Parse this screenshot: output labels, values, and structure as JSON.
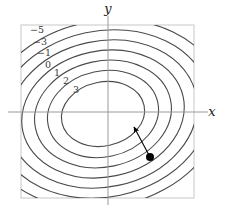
{
  "figure": {
    "title": "",
    "background_color": "#ffffff"
  },
  "axes": {
    "x_label": "x",
    "y_label": "y",
    "x_axis_color": "#9a9a9a",
    "y_axis_color": "#9a9a9a",
    "frame_color": "#c8c8c8",
    "origin_px": {
      "x": 108,
      "y": 112
    }
  },
  "chart_data": {
    "type": "line",
    "subtype": "contour",
    "title": "",
    "xlabel": "x",
    "ylabel": "y",
    "grid": false,
    "legend": null,
    "contour_color": "#4a4a4a",
    "labeled_levels": [
      -5,
      -3,
      -1,
      0,
      1,
      2,
      3
    ],
    "level_labels": [
      "-5",
      "-3",
      "-1",
      "0",
      "1",
      "2",
      "3"
    ],
    "label_positions_px": [
      {
        "label": "-5",
        "x": 37,
        "y": 33
      },
      {
        "label": "-3",
        "x": 40,
        "y": 45
      },
      {
        "label": "-1",
        "x": 44,
        "y": 56
      },
      {
        "label": "0",
        "x": 48,
        "y": 68
      },
      {
        "label": "1",
        "x": 57,
        "y": 76
      },
      {
        "label": "2",
        "x": 66,
        "y": 84
      },
      {
        "label": "3",
        "x": 76,
        "y": 93
      }
    ],
    "contours": [
      {
        "level": 3,
        "rx": 42,
        "ry": 32,
        "rotation_deg": -12
      },
      {
        "level": 2,
        "rx": 56,
        "ry": 43,
        "rotation_deg": -12
      },
      {
        "level": 1,
        "rx": 69,
        "ry": 53,
        "rotation_deg": -12
      },
      {
        "level": 0,
        "rx": 82,
        "ry": 63,
        "rotation_deg": -12
      },
      {
        "level": -1,
        "rx": 95,
        "ry": 73,
        "rotation_deg": -12
      },
      {
        "level": -3,
        "rx": 108,
        "ry": 83,
        "rotation_deg": -12
      },
      {
        "level": -5,
        "rx": 121,
        "ry": 93,
        "rotation_deg": -12
      }
    ],
    "center_px": {
      "x": 103,
      "y": 114
    },
    "annotation": {
      "type": "arrow_with_point",
      "point_px": {
        "x": 150,
        "y": 157
      },
      "arrow_tip_px": {
        "x": 134,
        "y": 127
      },
      "point_color": "#000000",
      "arrow_color": "#000000",
      "point_radius": 4
    },
    "frame_px": {
      "x0": 21,
      "y0": 25,
      "x1": 194,
      "y1": 198
    }
  }
}
